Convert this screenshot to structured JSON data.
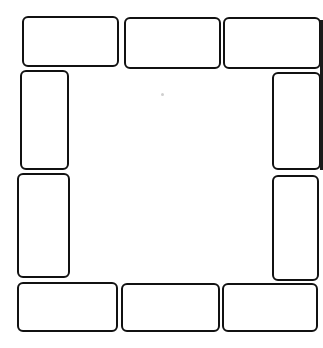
{
  "diagram": {
    "stroke_color": "#111111",
    "background": "#ffffff",
    "boxes": [
      {
        "id": "top-left",
        "x": 22,
        "y": 16,
        "w": 97,
        "h": 51
      },
      {
        "id": "top-middle",
        "x": 124,
        "y": 17,
        "w": 97,
        "h": 52
      },
      {
        "id": "top-right",
        "x": 223,
        "y": 17,
        "w": 98,
        "h": 52
      },
      {
        "id": "left-upper",
        "x": 20,
        "y": 70,
        "w": 49,
        "h": 100
      },
      {
        "id": "left-lower",
        "x": 17,
        "y": 173,
        "w": 53,
        "h": 105
      },
      {
        "id": "right-upper",
        "x": 272,
        "y": 72,
        "w": 49,
        "h": 98
      },
      {
        "id": "right-lower",
        "x": 272,
        "y": 175,
        "w": 47,
        "h": 106
      },
      {
        "id": "bottom-left",
        "x": 17,
        "y": 282,
        "w": 101,
        "h": 50
      },
      {
        "id": "bottom-middle",
        "x": 121,
        "y": 283,
        "w": 99,
        "h": 49
      },
      {
        "id": "bottom-right",
        "x": 222,
        "y": 283,
        "w": 96,
        "h": 49
      }
    ]
  }
}
